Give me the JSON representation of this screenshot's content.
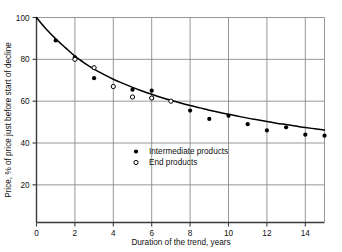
{
  "chart_data": {
    "type": "scatter",
    "title": "",
    "xlabel": "Duration of the trend, years",
    "ylabel": "Price, % of price just before start of decline",
    "xlim": [
      0,
      15
    ],
    "ylim": [
      2,
      100
    ],
    "xticks": [
      0,
      2,
      4,
      6,
      8,
      10,
      12,
      14
    ],
    "yticks": [
      20,
      40,
      60,
      80,
      100
    ],
    "xtick_labels": [
      "0",
      "2",
      "4",
      "6",
      "8",
      "10",
      "12",
      "14"
    ],
    "ytick_labels": [
      "20",
      "40",
      "60",
      "80",
      "100"
    ],
    "grid": true,
    "legend_position": "center-left-inside",
    "series": [
      {
        "name": "Intermediate products",
        "marker": "filled-circle",
        "color": "#000000",
        "points": [
          {
            "x": 1,
            "y": 89
          },
          {
            "x": 2,
            "y": 81
          },
          {
            "x": 3,
            "y": 71
          },
          {
            "x": 4,
            "y": 67
          },
          {
            "x": 5,
            "y": 65.5
          },
          {
            "x": 6,
            "y": 65
          },
          {
            "x": 6,
            "y": 61.5
          },
          {
            "x": 8,
            "y": 55.5
          },
          {
            "x": 9,
            "y": 51.5
          },
          {
            "x": 10,
            "y": 53
          },
          {
            "x": 11,
            "y": 49
          },
          {
            "x": 12,
            "y": 46
          },
          {
            "x": 13,
            "y": 47.5
          },
          {
            "x": 14,
            "y": 44
          },
          {
            "x": 15,
            "y": 43.5
          }
        ]
      },
      {
        "name": "End products",
        "marker": "open-circle",
        "color": "#000000",
        "points": [
          {
            "x": 2,
            "y": 80
          },
          {
            "x": 3,
            "y": 76
          },
          {
            "x": 4,
            "y": 67
          },
          {
            "x": 5,
            "y": 62
          },
          {
            "x": 6,
            "y": 61.5
          },
          {
            "x": 7,
            "y": 60
          }
        ]
      }
    ],
    "fit_curve": {
      "name": "trend-fit",
      "color": "#000000",
      "points": [
        {
          "x": 0,
          "y": 100
        },
        {
          "x": 0.5,
          "y": 94.5
        },
        {
          "x": 1,
          "y": 89.8
        },
        {
          "x": 1.5,
          "y": 85.6
        },
        {
          "x": 2,
          "y": 81.5
        },
        {
          "x": 2.5,
          "y": 78.2
        },
        {
          "x": 3,
          "y": 75.3
        },
        {
          "x": 3.5,
          "y": 72.8
        },
        {
          "x": 4,
          "y": 70.5
        },
        {
          "x": 4.5,
          "y": 68.5
        },
        {
          "x": 5,
          "y": 66.6
        },
        {
          "x": 5.5,
          "y": 64.9
        },
        {
          "x": 6,
          "y": 63.3
        },
        {
          "x": 6.5,
          "y": 61.8
        },
        {
          "x": 7,
          "y": 60.4
        },
        {
          "x": 7.5,
          "y": 59.1
        },
        {
          "x": 8,
          "y": 57.9
        },
        {
          "x": 8.5,
          "y": 56.8
        },
        {
          "x": 9,
          "y": 55.7
        },
        {
          "x": 9.5,
          "y": 54.7
        },
        {
          "x": 10,
          "y": 53.7
        },
        {
          "x": 10.5,
          "y": 52.8
        },
        {
          "x": 11,
          "y": 51.9
        },
        {
          "x": 11.5,
          "y": 51.1
        },
        {
          "x": 12,
          "y": 50.3
        },
        {
          "x": 12.5,
          "y": 49.5
        },
        {
          "x": 13,
          "y": 48.8
        },
        {
          "x": 13.5,
          "y": 48.1
        },
        {
          "x": 14,
          "y": 47.4
        },
        {
          "x": 14.5,
          "y": 46.8
        },
        {
          "x": 15,
          "y": 46.2
        }
      ]
    },
    "legend": [
      {
        "label": "Intermediate products",
        "marker": "filled-circle"
      },
      {
        "label": "End products",
        "marker": "open-circle"
      }
    ]
  }
}
